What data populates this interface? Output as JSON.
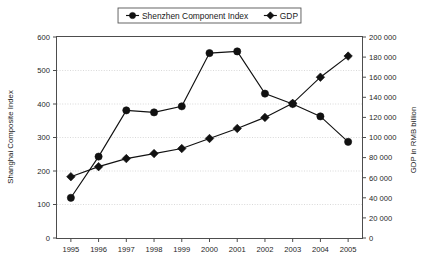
{
  "chart_data": {
    "type": "line",
    "title": "",
    "subtitle": "",
    "xlabel": "",
    "ylabel": "Shanghai Composite Index",
    "y2label": "GDP in RMB billion",
    "categories": [
      "1995",
      "1996",
      "1997",
      "1998",
      "1999",
      "2000",
      "2001",
      "2002",
      "2003",
      "2004",
      "2005"
    ],
    "x": [
      1995,
      1996,
      1997,
      1998,
      1999,
      2000,
      2001,
      2002,
      2003,
      2004,
      2005
    ],
    "ylim": [
      0,
      600
    ],
    "y2lim": [
      0,
      200000
    ],
    "yticks": [
      0,
      100,
      200,
      300,
      400,
      500,
      600
    ],
    "ytick_labels": [
      "0",
      "100",
      "200",
      "300",
      "400",
      "500",
      "600"
    ],
    "y2ticks": [
      0,
      20000,
      40000,
      60000,
      80000,
      100000,
      120000,
      140000,
      160000,
      180000,
      200000
    ],
    "y2tick_labels": [
      "0",
      "20 000",
      "40 000",
      "60 000",
      "80 000",
      "100 000",
      "120 000",
      "140 000",
      "160 000",
      "180 000",
      "200 000"
    ],
    "grid": true,
    "grid_axis": "y",
    "legend_position": "top-center",
    "series": [
      {
        "name": "Shenzhen Component Index",
        "axis": "left",
        "marker": "circle",
        "values": [
          120,
          243,
          381,
          375,
          393,
          552,
          557,
          431,
          400,
          363,
          287
        ]
      },
      {
        "name": "GDP",
        "axis": "right",
        "marker": "diamond",
        "values": [
          61000,
          71000,
          79000,
          84000,
          89000,
          99000,
          109000,
          120000,
          134000,
          160000,
          181000
        ]
      }
    ]
  },
  "legend": {
    "items": [
      {
        "label": "Shenzhen Component Index",
        "marker": "circle"
      },
      {
        "label": "GDP",
        "marker": "diamond"
      }
    ]
  },
  "axes": {
    "left_title": "Shanghai Composite Index",
    "right_title": "GDP in RMB billion"
  },
  "colors": {
    "series": "#111111",
    "frame": "#4d4d4d",
    "grid": "#c8c8c8",
    "text": "#1a1a1a",
    "background": "#ffffff"
  }
}
